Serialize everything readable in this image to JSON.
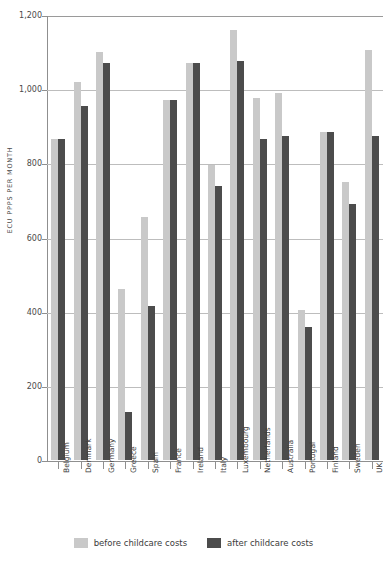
{
  "chart_data": {
    "type": "bar",
    "title": "",
    "xlabel": "",
    "ylabel": "ECU PPPS PER MONTH",
    "ylim": [
      0,
      1200
    ],
    "ytick_labels": [
      "1,200",
      "1,000",
      "800",
      "600",
      "400",
      "200",
      "0"
    ],
    "ytick_values": [
      1200,
      1000,
      800,
      600,
      400,
      200,
      0
    ],
    "grid": true,
    "legend_position": "bottom",
    "categories": [
      "Belgium",
      "Denmark",
      "Germany",
      "Greece",
      "Spain",
      "France",
      "Ireland",
      "Italy",
      "Luxembourg",
      "Netherlands",
      "Australia",
      "Portugal",
      "Finland",
      "Sweden",
      "UK"
    ],
    "series": [
      {
        "name": "before childcare costs",
        "color": "#c9c9c9",
        "values": [
          865,
          1020,
          1100,
          460,
          655,
          970,
          1070,
          795,
          1160,
          975,
          990,
          405,
          885,
          750,
          1105
        ]
      },
      {
        "name": "after childcare costs",
        "color": "#4c4c4c",
        "values": [
          865,
          955,
          1070,
          130,
          415,
          970,
          1070,
          740,
          1075,
          865,
          875,
          360,
          885,
          690,
          875
        ]
      }
    ]
  },
  "legend": {
    "items": [
      {
        "label": "before childcare costs",
        "swatch": "before"
      },
      {
        "label": "after childcare costs",
        "swatch": "after"
      }
    ]
  }
}
